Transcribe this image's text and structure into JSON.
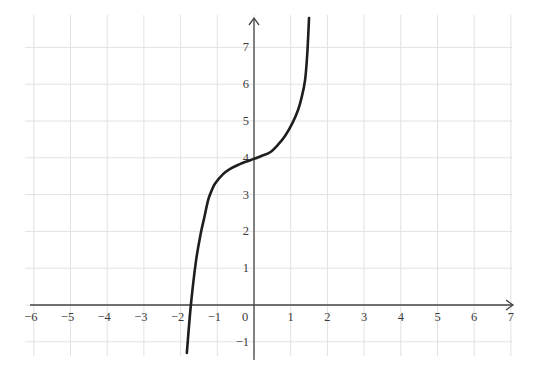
{
  "chart_data": {
    "type": "line",
    "title": "",
    "xlabel": "",
    "ylabel": "",
    "xlim": [
      -6.3,
      7.2
    ],
    "ylim": [
      -1.4,
      7.9
    ],
    "grid": true,
    "legend": null,
    "x_ticks": [
      -6,
      -5,
      -4,
      -3,
      -2,
      -1,
      0,
      1,
      2,
      3,
      4,
      5,
      6,
      7
    ],
    "y_ticks": [
      -1,
      1,
      2,
      3,
      4,
      5,
      6,
      7
    ],
    "x_tick_labels": [
      "−6",
      "−5",
      "−4",
      "−3",
      "−2",
      "−1",
      "0",
      "1",
      "2",
      "3",
      "4",
      "5",
      "6",
      "7"
    ],
    "y_tick_labels": [
      "−1",
      "1",
      "2",
      "3",
      "4",
      "5",
      "6",
      "7"
    ],
    "series": [
      {
        "name": "f(x)",
        "color": "#1e1e1e",
        "x": [
          -1.83,
          -1.72,
          -1.58,
          -1.45,
          -1.36,
          -1.25,
          -1.15,
          -1.06,
          -0.85,
          -0.65,
          -0.4,
          -0.2,
          0,
          0.2,
          0.44,
          0.65,
          0.85,
          1.05,
          1.2,
          1.3,
          1.39,
          1.45,
          1.5
        ],
        "y": [
          -1.3,
          0,
          1.2,
          1.95,
          2.35,
          2.85,
          3.12,
          3.3,
          3.55,
          3.7,
          3.82,
          3.9,
          3.97,
          4.05,
          4.15,
          4.35,
          4.6,
          4.95,
          5.3,
          5.65,
          6.1,
          6.8,
          7.8
        ]
      }
    ]
  }
}
